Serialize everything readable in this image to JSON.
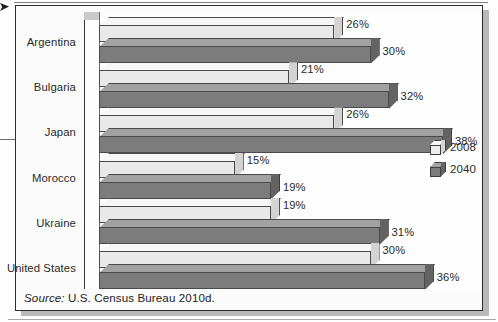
{
  "chart_data": {
    "type": "bar",
    "orientation": "horizontal",
    "title": "",
    "subtitle": "",
    "xlabel": "",
    "ylabel": "",
    "grid": false,
    "legend_position": "right",
    "xlim": [
      0,
      40
    ],
    "value_suffix": "%",
    "categories": [
      "Argentina",
      "Bulgaria",
      "Japan",
      "Morocco",
      "Ukraine",
      "United States"
    ],
    "series": [
      {
        "name": "2008",
        "color": "#e9e9e9",
        "values": [
          26,
          21,
          26,
          15,
          19,
          30
        ],
        "labels": [
          "26%",
          "21%",
          "26%",
          "15%",
          "19%",
          "30%"
        ]
      },
      {
        "name": "2040",
        "color": "#7c7c7c",
        "values": [
          30,
          32,
          38,
          19,
          31,
          36
        ],
        "labels": [
          "30%",
          "32%",
          "38%",
          "19%",
          "31%",
          "36%"
        ]
      }
    ]
  },
  "legend": {
    "items": [
      {
        "label": "2008",
        "swatch": "cube-light-icon"
      },
      {
        "label": "2040",
        "swatch": "cube-dark-icon"
      }
    ]
  },
  "source": {
    "prefix": "Source:",
    "text": " U.S. Census Bureau 2010d."
  }
}
